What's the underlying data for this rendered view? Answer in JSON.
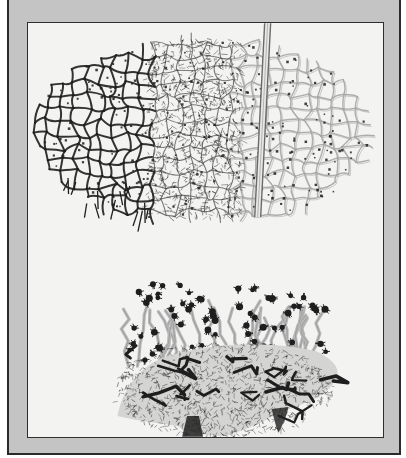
{
  "figure": {
    "colors": {
      "mat": "#c4c4c4",
      "frame_line": "#2a2a2a",
      "paper": "#f3f3f2",
      "ink_dark": "#1e1e1e",
      "ink_mid": "#6a6a6a",
      "ink_light": "#a5a5a5"
    },
    "upper_specimen": {
      "label": "upper network",
      "center": [
        175,
        110
      ],
      "radius": [
        170,
        95
      ],
      "vessel": {
        "x_top": 241,
        "x_bottom": 231,
        "y_top": 0,
        "y_bottom": 195
      }
    },
    "lower_specimen": {
      "label": "lower network",
      "center": [
        190,
        340
      ],
      "radius": [
        130,
        70
      ]
    }
  }
}
